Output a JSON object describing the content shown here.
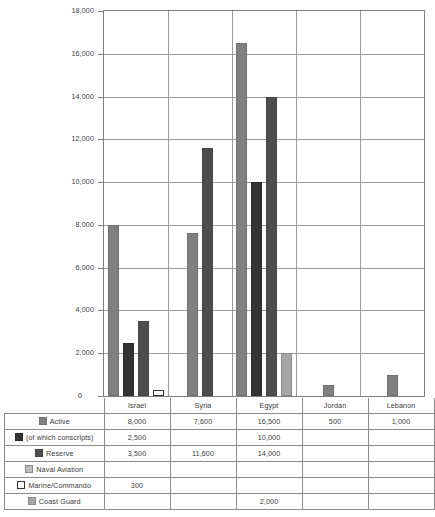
{
  "chart_data": {
    "type": "bar",
    "title": "",
    "xlabel": "",
    "ylabel": "",
    "ylim": [
      0,
      18000
    ],
    "grid": true,
    "legend_position": "table-left",
    "categories": [
      "Israel",
      "Syria",
      "Egypt",
      "Jordan",
      "Lebanon"
    ],
    "ytick_labels": [
      "18,000",
      "16,000",
      "14,000",
      "12,000",
      "10,000",
      "8,000",
      "6,000",
      "4,000",
      "2,000",
      "0"
    ],
    "ytick_values": [
      18000,
      16000,
      14000,
      12000,
      10000,
      8000,
      6000,
      4000,
      2000,
      0
    ],
    "series": [
      {
        "name": "Active",
        "color": "#808080",
        "border": "#707070",
        "values": [
          8000,
          7600,
          16500,
          500,
          1000
        ],
        "labels": [
          "8,000",
          "7,600",
          "16,500",
          "500",
          "1,000"
        ]
      },
      {
        "name": "(of  which conscripts)",
        "color": "#333333",
        "border": "#2b2b2b",
        "values": [
          2500,
          null,
          10000,
          null,
          null
        ],
        "labels": [
          "2,500",
          "",
          "10,000",
          "",
          ""
        ]
      },
      {
        "name": "Reserve",
        "color": "#4d4d4d",
        "border": "#444444",
        "values": [
          3500,
          11600,
          14000,
          null,
          null
        ],
        "labels": [
          "3,500",
          "11,600",
          "14,000",
          "",
          ""
        ]
      },
      {
        "name": "Naval Aviation",
        "color": "#bdbdbd",
        "border": "#8a8a8a",
        "values": [
          null,
          null,
          null,
          null,
          null
        ],
        "labels": [
          "",
          "",
          "",
          "",
          ""
        ]
      },
      {
        "name": "Marine/Commando",
        "color": "#ffffff",
        "border": "#333333",
        "values": [
          300,
          null,
          null,
          null,
          null
        ],
        "labels": [
          "300",
          "",
          "",
          "",
          ""
        ]
      },
      {
        "name": "Coast Guard",
        "color": "#a6a6a6",
        "border": "#8a8a8a",
        "values": [
          null,
          null,
          2000,
          null,
          null
        ],
        "labels": [
          "",
          "",
          "2,000",
          "",
          ""
        ]
      }
    ]
  },
  "table": {
    "header": [
      "",
      "Israel",
      "Syria",
      "Egypt",
      "Jordan",
      "Lebanon"
    ],
    "rows": [
      {
        "label": "Active",
        "cells": [
          "8,000",
          "7,600",
          "16,500",
          "500",
          "1,000"
        ]
      },
      {
        "label": "(of  which conscripts)",
        "cells": [
          "2,500",
          "",
          "10,000",
          "",
          ""
        ]
      },
      {
        "label": "Reserve",
        "cells": [
          "3,500",
          "11,600",
          "14,000",
          "",
          ""
        ]
      },
      {
        "label": "Naval Aviation",
        "cells": [
          "",
          "",
          "",
          "",
          ""
        ]
      },
      {
        "label": "Marine/Commando",
        "cells": [
          "300",
          "",
          "",
          "",
          ""
        ]
      },
      {
        "label": "Coast Guard",
        "cells": [
          "",
          "",
          "2,000",
          "",
          ""
        ]
      }
    ]
  },
  "axis": {
    "zero_label": "0"
  }
}
